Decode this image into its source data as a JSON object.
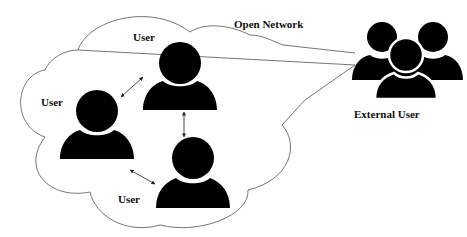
{
  "diagram": {
    "cloud_label": "Open Network",
    "users": [
      {
        "id": "user-top",
        "label": "User"
      },
      {
        "id": "user-left",
        "label": "User"
      },
      {
        "id": "user-bottom",
        "label": "User"
      }
    ],
    "external": {
      "label": "External User"
    },
    "colors": {
      "icon": "#000000",
      "outline": "#666666",
      "background": "#ffffff"
    }
  }
}
